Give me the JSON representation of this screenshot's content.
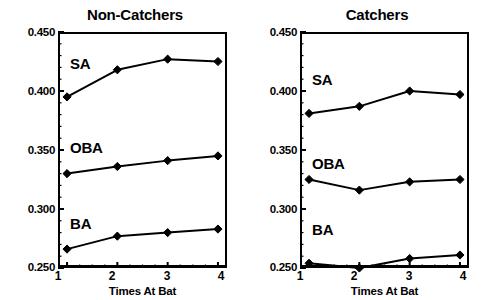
{
  "figure": {
    "background": "#ffffff",
    "ink_color": "#000000"
  },
  "chart_data": [
    {
      "type": "line",
      "title": "Non-Catchers",
      "xlabel": "Times At Bat",
      "ylabel": "",
      "x": [
        1,
        2,
        3,
        4
      ],
      "xtick_labels": [
        "1",
        "2",
        "3",
        "4"
      ],
      "ytick_labels": [
        "0.250",
        "0.300",
        "0.350",
        "0.400",
        "0.450"
      ],
      "yticks": [
        0.25,
        0.3,
        0.35,
        0.4,
        0.45
      ],
      "ylim": [
        0.25,
        0.45
      ],
      "xlim": [
        0.82,
        4.18
      ],
      "grid": false,
      "legend": "inline-labels",
      "marker": "diamond",
      "series": [
        {
          "name": "SA",
          "label": "SA",
          "values": [
            0.395,
            0.418,
            0.427,
            0.425
          ]
        },
        {
          "name": "OBA",
          "label": "OBA",
          "values": [
            0.33,
            0.336,
            0.341,
            0.345
          ]
        },
        {
          "name": "BA",
          "label": "BA",
          "values": [
            0.266,
            0.277,
            0.28,
            0.283
          ]
        }
      ]
    },
    {
      "type": "line",
      "title": "Catchers",
      "xlabel": "Times At Bat",
      "ylabel": "",
      "x": [
        1,
        2,
        3,
        4
      ],
      "xtick_labels": [
        "1",
        "2",
        "3",
        "4"
      ],
      "ytick_labels": [
        "0.250",
        "0.300",
        "0.350",
        "0.400",
        "0.450"
      ],
      "yticks": [
        0.25,
        0.3,
        0.35,
        0.4,
        0.45
      ],
      "ylim": [
        0.25,
        0.45
      ],
      "xlim": [
        0.82,
        4.18
      ],
      "grid": false,
      "legend": "inline-labels",
      "marker": "diamond",
      "series": [
        {
          "name": "SA",
          "label": "SA",
          "values": [
            0.381,
            0.387,
            0.4,
            0.397
          ]
        },
        {
          "name": "OBA",
          "label": "OBA",
          "values": [
            0.325,
            0.316,
            0.323,
            0.325
          ]
        },
        {
          "name": "BA",
          "label": "BA",
          "values": [
            0.254,
            0.25,
            0.258,
            0.261
          ]
        }
      ]
    }
  ]
}
